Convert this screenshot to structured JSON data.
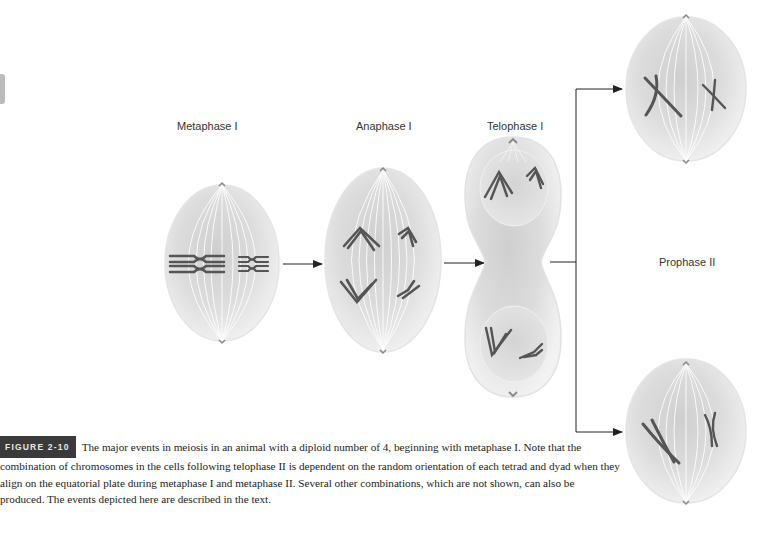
{
  "figure": {
    "badge": "FIGURE 2-10",
    "caption": "The major events in meiosis in an animal with a diploid number of 4, beginning with metaphase I. Note that the combination of chromosomes in the cells following telophase II is dependent on the random orientation of each tetrad and dyad when they align on the equatorial plate during metaphase I and metaphase II. Several other combinations, which are not shown, can also be produced. The events depicted here are described in the text."
  },
  "stages": [
    {
      "id": "metaphase-1",
      "label": "Metaphase I"
    },
    {
      "id": "anaphase-1",
      "label": "Anaphase I"
    },
    {
      "id": "telophase-1",
      "label": "Telophase I"
    },
    {
      "id": "prophase-2",
      "label": "Prophase II"
    }
  ],
  "colors": {
    "cell_fill": "#d6d6d6",
    "cell_light": "#eeeeee",
    "spindle": "#ffffff",
    "chromosome": "#555555",
    "arrow": "#222222",
    "badge_bg": "#3a3a3a"
  }
}
